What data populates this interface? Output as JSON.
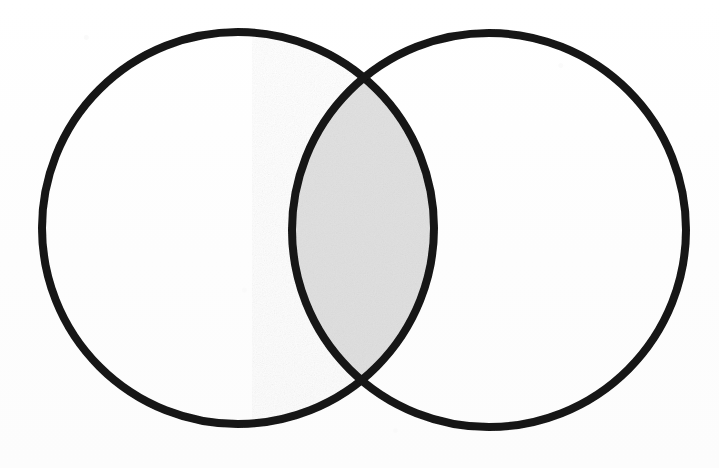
{
  "figure": {
    "kind": "venn-diagram",
    "title": "",
    "caption": "",
    "background_color": "#ffffff",
    "stroke_color": "#141414",
    "stroke_width": 8,
    "canvas": {
      "width": 719,
      "height": 468
    }
  },
  "chart_data": {
    "type": "venn",
    "title": "",
    "subtitle": "",
    "xlabel": "",
    "ylabel": "",
    "grid": false,
    "legend": "none",
    "annotations": [],
    "set_count": 2,
    "sets": [
      {
        "id": "A",
        "label": "",
        "shape": "circle",
        "cx": 238,
        "cy": 228,
        "r": 196,
        "fill": "#ffffff",
        "stroke": "#141414",
        "stroke_width": 8,
        "highlighted": false
      },
      {
        "id": "B",
        "label": "",
        "shape": "circle",
        "cx": 489,
        "cy": 230,
        "r": 197,
        "fill": "#ffffff",
        "stroke": "#141414",
        "stroke_width": 8,
        "highlighted": false
      }
    ],
    "regions": [
      {
        "id": "A-only",
        "label": "",
        "value": "",
        "fill": "#ffffff",
        "shaded": false
      },
      {
        "id": "B-only",
        "label": "",
        "value": "",
        "fill": "#ffffff",
        "shaded": false
      },
      {
        "id": "A-and-B",
        "label": "",
        "value": "",
        "fill": "#e2e2e2",
        "shaded": true,
        "description": "lens-shaped intersection, shaded light gray",
        "bounds": {
          "x_left": 292,
          "x_right": 443,
          "y_top": 72,
          "y_bottom": 383
        }
      }
    ],
    "intersection_points": [
      {
        "x": 372,
        "y": 72
      },
      {
        "x": 367,
        "y": 383
      }
    ]
  }
}
